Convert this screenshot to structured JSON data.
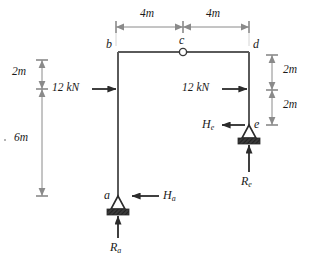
{
  "figure": {
    "type": "structural-frame-free-body-diagram",
    "title": "",
    "units": "m / kN"
  },
  "nodes": {
    "b": {
      "label": "b",
      "x": 118,
      "y": 52
    },
    "c": {
      "label": "c",
      "x": 183,
      "y": 52
    },
    "d": {
      "label": "d",
      "x": 249,
      "y": 52
    },
    "a": {
      "label": "a",
      "x": 118,
      "y": 196
    },
    "e": {
      "label": "e",
      "x": 249,
      "y": 125
    }
  },
  "hinge": {
    "name": "internal-hinge-c",
    "at": "c"
  },
  "dimensions": {
    "top": [
      {
        "label": "4m",
        "from": "b",
        "to": "c"
      },
      {
        "label": "4m",
        "from": "c",
        "to": "d"
      }
    ],
    "left": [
      {
        "label": "2m",
        "span": "top-to-load"
      },
      {
        "label": "6m",
        "span": "load-to-base"
      }
    ],
    "right": [
      {
        "label": "2m",
        "span": "d-to-load"
      },
      {
        "label": "2m",
        "span": "load-to-e"
      }
    ]
  },
  "loads": [
    {
      "name": "load-left",
      "label": "12 kN",
      "direction": "right",
      "applied_at": "left-column"
    },
    {
      "name": "load-right",
      "label": "12 kN",
      "direction": "right",
      "applied_at": "right-column"
    }
  ],
  "reactions": [
    {
      "name": "horizontal-reaction-a",
      "label": "H",
      "subscript": "a",
      "direction": "left",
      "at": "a"
    },
    {
      "name": "vertical-reaction-a",
      "label": "R",
      "subscript": "a",
      "direction": "up",
      "at": "a"
    },
    {
      "name": "horizontal-reaction-e",
      "label": "H",
      "subscript": "e",
      "direction": "left",
      "at": "e"
    },
    {
      "name": "vertical-reaction-e",
      "label": "R",
      "subscript": "e",
      "direction": "up",
      "at": "e"
    }
  ],
  "supports": [
    {
      "name": "pin-support-a",
      "at": "a",
      "kind": "pin"
    },
    {
      "name": "pin-support-e",
      "at": "e",
      "kind": "pin"
    }
  ],
  "colors": {
    "member": "#5a5a5a",
    "dimension": "#8a8a8a",
    "arrow": "#2b2b2b",
    "text": "#1a1a1a",
    "support": "#2b2b2b",
    "background": "#ffffff"
  }
}
